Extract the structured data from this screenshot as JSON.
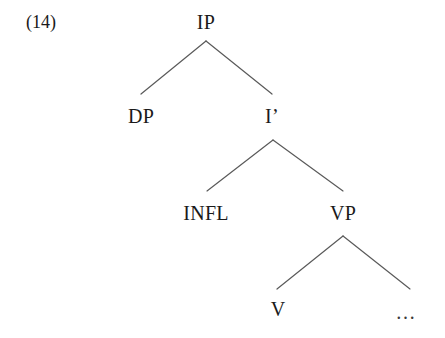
{
  "figure": {
    "example_number": "(14)",
    "caption": "",
    "background_color": "#ffffff",
    "text_color": "#1a1a1a",
    "branch_color": "#5a5a5a"
  },
  "tree": {
    "type": "syntax-tree",
    "nodes": [
      {
        "id": "ip",
        "label": "IP",
        "x": 206,
        "y": 22
      },
      {
        "id": "dp",
        "label": "DP",
        "x": 141,
        "y": 116
      },
      {
        "id": "ibar",
        "label": "I’",
        "x": 272,
        "y": 116
      },
      {
        "id": "infl",
        "label": "INFL",
        "x": 206,
        "y": 213
      },
      {
        "id": "vp",
        "label": "VP",
        "x": 343,
        "y": 213
      },
      {
        "id": "v",
        "label": "V",
        "x": 278,
        "y": 309
      },
      {
        "id": "ellipsis",
        "label": "…",
        "x": 406,
        "y": 312
      }
    ],
    "edges": [
      {
        "from": "ip",
        "to": "dp",
        "x1": 206,
        "y1": 41,
        "x2": 141,
        "y2": 94
      },
      {
        "from": "ip",
        "to": "ibar",
        "x1": 206,
        "y1": 41,
        "x2": 272,
        "y2": 94
      },
      {
        "from": "ibar",
        "to": "infl",
        "x1": 273,
        "y1": 140,
        "x2": 207,
        "y2": 191
      },
      {
        "from": "ibar",
        "to": "vp",
        "x1": 273,
        "y1": 140,
        "x2": 343,
        "y2": 191
      },
      {
        "from": "vp",
        "to": "v",
        "x1": 343,
        "y1": 236,
        "x2": 277,
        "y2": 289
      },
      {
        "from": "vp",
        "to": "ellipsis",
        "x1": 343,
        "y1": 236,
        "x2": 410,
        "y2": 289
      }
    ]
  },
  "example_label": {
    "text": "(14)",
    "x": 26,
    "y": 22
  }
}
